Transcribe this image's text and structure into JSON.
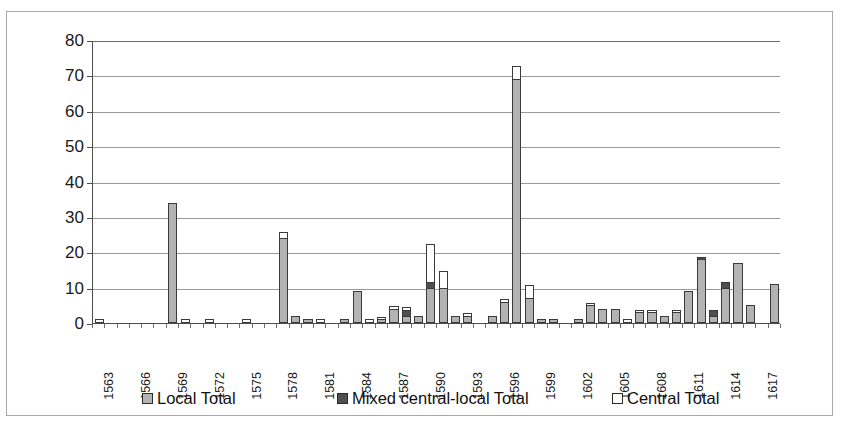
{
  "chart_data": {
    "type": "bar",
    "stacked": true,
    "title": "",
    "subtitle": "",
    "xlabel": "",
    "ylabel": "",
    "ylim": [
      0,
      80
    ],
    "ytick_values": [
      0,
      10,
      20,
      30,
      40,
      50,
      60,
      70,
      80
    ],
    "ytick_labels": [
      "0",
      "10",
      "20",
      "30",
      "40",
      "50",
      "60",
      "70",
      "80"
    ],
    "grid": "horizontal",
    "legend_position": "bottom",
    "x": [
      1563,
      1564,
      1565,
      1566,
      1567,
      1568,
      1569,
      1570,
      1571,
      1572,
      1573,
      1574,
      1575,
      1576,
      1577,
      1578,
      1579,
      1580,
      1581,
      1582,
      1583,
      1584,
      1585,
      1586,
      1587,
      1588,
      1589,
      1590,
      1591,
      1592,
      1593,
      1594,
      1595,
      1596,
      1597,
      1598,
      1599,
      1600,
      1601,
      1602,
      1603,
      1604,
      1605,
      1606,
      1607,
      1608,
      1609,
      1610,
      1611,
      1612,
      1613,
      1614,
      1615,
      1616,
      1617,
      1618
    ],
    "xtick_labels": [
      "1563",
      "1566",
      "1569",
      "1572",
      "1575",
      "1578",
      "1581",
      "1584",
      "1587",
      "1590",
      "1593",
      "1596",
      "1599",
      "1602",
      "1605",
      "1608",
      "1611",
      "1614",
      "1617"
    ],
    "xtick_values": [
      1563,
      1566,
      1569,
      1572,
      1575,
      1578,
      1581,
      1584,
      1587,
      1590,
      1593,
      1596,
      1599,
      1602,
      1605,
      1608,
      1611,
      1614,
      1617
    ],
    "series": [
      {
        "name": "Local Total",
        "color": "#b3b3b3",
        "values": [
          0,
          0,
          0,
          0,
          0,
          0,
          34,
          0,
          0,
          0,
          0,
          0,
          0,
          0,
          0,
          24,
          2,
          1,
          0,
          0,
          1,
          9,
          0,
          1,
          4,
          2,
          2,
          10,
          10,
          2,
          2,
          0,
          2,
          6,
          69,
          7,
          1,
          1,
          0,
          1,
          5,
          4,
          4,
          0,
          3,
          3,
          2,
          3,
          9,
          18,
          2,
          10,
          17,
          5,
          0,
          11
        ]
      },
      {
        "name": "Mixed central-local Total",
        "color": "#4f4f4f",
        "values": [
          0,
          0,
          0,
          0,
          0,
          0,
          0,
          0,
          0,
          0,
          0,
          0,
          0,
          0,
          0,
          0,
          0,
          0,
          0,
          0,
          0,
          0,
          0,
          0,
          0,
          2,
          0,
          2,
          0,
          0,
          0,
          0,
          0,
          0,
          0,
          0,
          0,
          0,
          0,
          0,
          0,
          0,
          0,
          0,
          0,
          0,
          0,
          0,
          0,
          1,
          2,
          2,
          0,
          0,
          0,
          0
        ]
      },
      {
        "name": "Central Total",
        "color": "#ffffff",
        "values": [
          1,
          0,
          0,
          0,
          0,
          0,
          0,
          1,
          0,
          1,
          0,
          0,
          1,
          0,
          0,
          2,
          0,
          0,
          1,
          0,
          0,
          0,
          1,
          1,
          1,
          1,
          0,
          11,
          5,
          0,
          1,
          0,
          0,
          1,
          4,
          4,
          0,
          0,
          0,
          0,
          1,
          0,
          0,
          1,
          1,
          1,
          0,
          1,
          0,
          0,
          0,
          0,
          0,
          0,
          0,
          0
        ]
      }
    ],
    "legend": [
      {
        "label": "Local Total",
        "swatch": "local"
      },
      {
        "label": "Mixed central-local Total",
        "swatch": "mixed"
      },
      {
        "label": "Central Total",
        "swatch": "central"
      }
    ]
  }
}
